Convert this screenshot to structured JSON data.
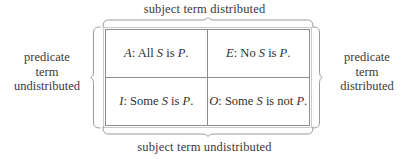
{
  "figure": {
    "type": "logic-distribution-table",
    "background_color": "#ffffff",
    "text_color": "#3a3a3a",
    "rule_color": "#8d8d8d",
    "brace_color": "#9a9a9a"
  },
  "captions": {
    "top": "subject term distributed",
    "bottom": "subject term undistributed",
    "left": {
      "line1": "predicate",
      "line2": "term",
      "line3": "undistributed"
    },
    "right": {
      "line1": "predicate",
      "line2": "term",
      "line3": "distributed"
    }
  },
  "table": {
    "columns": 2,
    "rows": 2,
    "cells": [
      {
        "position": "top-left",
        "letter": "A",
        "separator": ": ",
        "quantifier": "All ",
        "subject": "S",
        "copula": " is ",
        "predicate": "P",
        "terminator": ".",
        "full_text": "A: All S is P."
      },
      {
        "position": "top-right",
        "letter": "E",
        "separator": ": ",
        "quantifier": "No ",
        "subject": "S",
        "copula": " is ",
        "predicate": "P",
        "terminator": ".",
        "full_text": "E: No S is P."
      },
      {
        "position": "bottom-left",
        "letter": "I",
        "separator": ": ",
        "quantifier": "Some ",
        "subject": "S",
        "copula": " is ",
        "predicate": "P",
        "terminator": ".",
        "full_text": "I: Some S is P."
      },
      {
        "position": "bottom-right",
        "letter": "O",
        "separator": ": ",
        "quantifier": "Some ",
        "subject": "S",
        "copula": " is not ",
        "predicate": "P",
        "terminator": ".",
        "full_text": "O: Some S is not P."
      }
    ]
  },
  "braces": {
    "top": "brace-up",
    "bottom": "brace-down",
    "left": "brace-left",
    "right": "brace-right"
  }
}
